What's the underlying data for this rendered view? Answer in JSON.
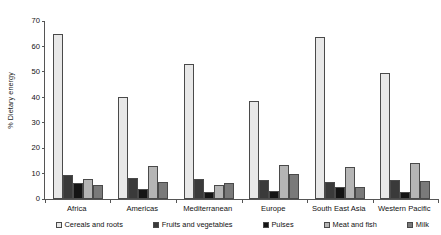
{
  "chart_data": {
    "type": "bar",
    "title": "",
    "xlabel": "",
    "ylabel": "% Dietary energy",
    "ylim": [
      0,
      70
    ],
    "yticks": [
      0,
      10,
      20,
      30,
      40,
      50,
      60,
      70
    ],
    "grid": false,
    "legend_position": "bottom",
    "categories": [
      "Africa",
      "Americas",
      "Mediterranean",
      "Europe",
      "South East Asia",
      "Western Pacific"
    ],
    "series": [
      {
        "name": "Cereals and roots",
        "color": "#e8e8e8",
        "values": [
          64.8,
          40.1,
          53.1,
          38.7,
          63.7,
          49.7
        ]
      },
      {
        "name": "Fruits and vegetables",
        "color": "#3a3a3a",
        "values": [
          9.6,
          8.1,
          7.8,
          7.5,
          6.7,
          7.4
        ]
      },
      {
        "name": "Pulses",
        "color": "#141414",
        "values": [
          6.2,
          4.1,
          2.7,
          3.0,
          4.6,
          2.7
        ]
      },
      {
        "name": "Meat and fish",
        "color": "#b5b5b5",
        "values": [
          8.0,
          12.9,
          5.4,
          13.2,
          12.6,
          14.2
        ]
      },
      {
        "name": "Milk",
        "color": "#7a7a7a",
        "values": [
          5.5,
          6.5,
          6.3,
          9.8,
          4.7,
          6.9
        ]
      }
    ]
  },
  "axis": {
    "y_title": "% Dietary energy"
  }
}
